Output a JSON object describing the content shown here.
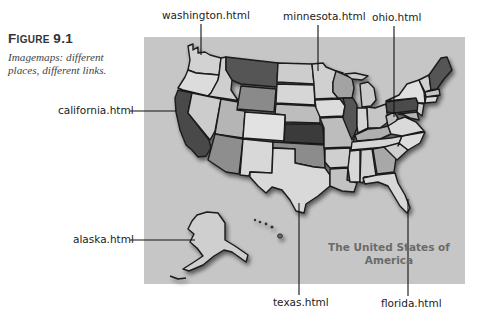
{
  "figure": {
    "number_prefix": "F",
    "number_rest": "IGURE",
    "number": "9.1",
    "caption": "Imagemaps: different places, different links."
  },
  "map": {
    "title_line1": "The United States of",
    "title_line2": "America",
    "background": "#c4c4c4"
  },
  "callouts": [
    {
      "id": "washington",
      "label": "washington.html"
    },
    {
      "id": "minnesota",
      "label": "minnesota.html"
    },
    {
      "id": "ohio",
      "label": "ohio.html"
    },
    {
      "id": "california",
      "label": "california.html"
    },
    {
      "id": "alaska",
      "label": "alaska.html"
    },
    {
      "id": "texas",
      "label": "texas.html"
    },
    {
      "id": "florida",
      "label": "florida.html"
    }
  ]
}
